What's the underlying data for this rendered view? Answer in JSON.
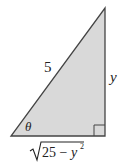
{
  "diagram": {
    "type": "right-triangle",
    "fill_color": "#d9d9d9",
    "stroke_color": "#444444",
    "labels": {
      "hypotenuse": "5",
      "vertical_side": "y",
      "angle": "θ",
      "base_radicand": "25 − y",
      "base_exponent": "2"
    }
  }
}
